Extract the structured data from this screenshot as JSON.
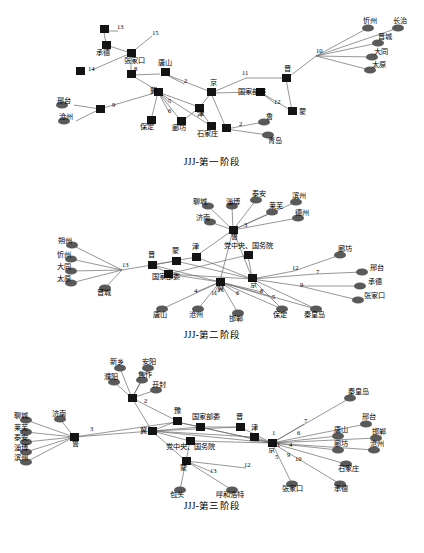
{
  "figure": {
    "title": "",
    "panels": [
      {
        "id": "panel1",
        "caption": "JJJ-第一阶段",
        "width": 424,
        "height": 150,
        "nodes": [
          {
            "id": "p1n1",
            "label": "承德",
            "shape": "square",
            "x": 106,
            "y": 42
          },
          {
            "id": "p1n2",
            "label": "",
            "shape": "square",
            "x": 104,
            "y": 25
          },
          {
            "id": "p1n3",
            "label": "13",
            "shape": "text",
            "x": 120,
            "y": 24
          },
          {
            "id": "p1n4",
            "label": "15",
            "shape": "text",
            "x": 156,
            "y": 30
          },
          {
            "id": "p1n5",
            "label": "张家口",
            "shape": "square",
            "x": 132,
            "y": 50
          },
          {
            "id": "p1n6",
            "label": "14",
            "shape": "text",
            "x": 92,
            "y": 63
          },
          {
            "id": "p1n7",
            "label": "",
            "shape": "square",
            "x": 80,
            "y": 67
          },
          {
            "id": "p1n8",
            "label": "8",
            "shape": "text",
            "x": 132,
            "y": 72
          },
          {
            "id": "p1n9",
            "label": "唐山",
            "shape": "square",
            "x": 165,
            "y": 68
          },
          {
            "id": "p1n10",
            "label": "2",
            "shape": "text",
            "x": 186,
            "y": 80
          },
          {
            "id": "p1n11",
            "label": "冀",
            "shape": "square",
            "x": 158,
            "y": 88
          },
          {
            "id": "p1n12",
            "label": "5",
            "shape": "text",
            "x": 170,
            "y": 98
          },
          {
            "id": "p1n13",
            "label": "6",
            "shape": "text",
            "x": 170,
            "y": 110
          },
          {
            "id": "p1n14",
            "label": "保定",
            "shape": "square",
            "x": 151,
            "y": 118
          },
          {
            "id": "p1n15",
            "label": "廊坊",
            "shape": "square",
            "x": 182,
            "y": 119
          },
          {
            "id": "p1n16",
            "label": "石家庄",
            "shape": "square",
            "x": 212,
            "y": 122
          },
          {
            "id": "p1n17",
            "label": "津",
            "shape": "square",
            "x": 200,
            "y": 104
          },
          {
            "id": "p1n18",
            "label": "京",
            "shape": "square",
            "x": 213,
            "y": 88
          },
          {
            "id": "p1n19",
            "label": "11",
            "shape": "text",
            "x": 248,
            "y": 72
          },
          {
            "id": "p1n20",
            "label": "晋",
            "shape": "square",
            "x": 288,
            "y": 74
          },
          {
            "id": "p1n21",
            "label": "国家部委",
            "shape": "square",
            "x": 262,
            "y": 88
          },
          {
            "id": "p1n22",
            "label": "12",
            "shape": "text",
            "x": 277,
            "y": 100
          },
          {
            "id": "p1n23",
            "label": "蒙",
            "shape": "square",
            "x": 294,
            "y": 108
          },
          {
            "id": "p1n24",
            "label": "10",
            "shape": "text",
            "x": 318,
            "y": 50
          },
          {
            "id": "p1n25",
            "label": "忻州",
            "shape": "ellipse",
            "x": 379,
            "y": 22
          },
          {
            "id": "p1n26",
            "label": "长治",
            "shape": "ellipse",
            "x": 410,
            "y": 22
          },
          {
            "id": "p1n27",
            "label": "晋城",
            "shape": "ellipse",
            "x": 388,
            "y": 38
          },
          {
            "id": "p1n28",
            "label": "大同",
            "shape": "ellipse",
            "x": 383,
            "y": 52
          },
          {
            "id": "p1n29",
            "label": "太原",
            "shape": "ellipse",
            "x": 380,
            "y": 66
          },
          {
            "id": "p1n30",
            "label": "邢台",
            "shape": "ellipse",
            "x": 72,
            "y": 102
          },
          {
            "id": "p1n31",
            "label": "沧州",
            "shape": "ellipse",
            "x": 74,
            "y": 118
          },
          {
            "id": "p1n32",
            "label": "9",
            "shape": "text",
            "x": 114,
            "y": 102
          },
          {
            "id": "p1n33",
            "label": "",
            "shape": "square",
            "x": 100,
            "y": 106
          },
          {
            "id": "p1n34",
            "label": "2",
            "shape": "text",
            "x": 240,
            "y": 122
          },
          {
            "id": "p1n35",
            "label": "",
            "shape": "square",
            "x": 228,
            "y": 125
          },
          {
            "id": "p1n36",
            "label": "鲁",
            "shape": "ellipse",
            "x": 272,
            "y": 117
          },
          {
            "id": "p1n37",
            "label": "青岛",
            "shape": "ellipse",
            "x": 278,
            "y": 132
          }
        ],
        "edge_labels": [
          "13",
          "15",
          "14",
          "8",
          "2",
          "5",
          "6",
          "11",
          "12",
          "10",
          "9",
          "2"
        ]
      },
      {
        "id": "panel2",
        "caption": "JJJ-第二阶段",
        "width": 424,
        "height": 145,
        "nodes": [
          {
            "id": "p2n1",
            "label": "聊城",
            "shape": "ellipse",
            "x": 212,
            "y": 22
          },
          {
            "id": "p2n2",
            "label": "淄博",
            "shape": "ellipse",
            "x": 238,
            "y": 22
          },
          {
            "id": "p2n3",
            "label": "泰安",
            "shape": "ellipse",
            "x": 262,
            "y": 16
          },
          {
            "id": "p2n4",
            "label": "莱芜",
            "shape": "ellipse",
            "x": 278,
            "y": 28
          },
          {
            "id": "p2n5",
            "label": "滨州",
            "shape": "ellipse",
            "x": 302,
            "y": 18
          },
          {
            "id": "p2n6",
            "label": "德州",
            "shape": "ellipse",
            "x": 304,
            "y": 34
          },
          {
            "id": "p2n7",
            "label": "济南",
            "shape": "ellipse",
            "x": 214,
            "y": 38
          },
          {
            "id": "p2n8",
            "label": "3",
            "shape": "text",
            "x": 246,
            "y": 44
          },
          {
            "id": "p2n9",
            "label": "鲁",
            "shape": "square",
            "x": 233,
            "y": 47
          },
          {
            "id": "p2n10",
            "label": "朔州",
            "shape": "ellipse",
            "x": 63,
            "y": 62
          },
          {
            "id": "p2n11",
            "label": "忻州",
            "shape": "ellipse",
            "x": 62,
            "y": 76
          },
          {
            "id": "p2n12",
            "label": "大同",
            "shape": "ellipse",
            "x": 62,
            "y": 88
          },
          {
            "id": "p2n13",
            "label": "太原",
            "shape": "ellipse",
            "x": 62,
            "y": 100
          },
          {
            "id": "p2n14",
            "label": "晋城",
            "shape": "ellipse",
            "x": 105,
            "y": 106
          },
          {
            "id": "p2n15",
            "label": "13",
            "shape": "text",
            "x": 122,
            "y": 84
          },
          {
            "id": "p2n16",
            "label": "晋",
            "shape": "square",
            "x": 152,
            "y": 82
          },
          {
            "id": "p2n17",
            "label": "蒙",
            "shape": "square",
            "x": 176,
            "y": 78
          },
          {
            "id": "p2n18",
            "label": "津",
            "shape": "square",
            "x": 196,
            "y": 74
          },
          {
            "id": "p2n19",
            "label": "国家部委",
            "shape": "square",
            "x": 168,
            "y": 92
          },
          {
            "id": "p2n20",
            "label": "党中央、国务院",
            "shape": "square",
            "x": 250,
            "y": 72
          },
          {
            "id": "p2n21",
            "label": "京",
            "shape": "square",
            "x": 252,
            "y": 96
          },
          {
            "id": "p2n22",
            "label": "12",
            "shape": "text",
            "x": 296,
            "y": 88
          },
          {
            "id": "p2n23",
            "label": "7",
            "shape": "text",
            "x": 318,
            "y": 92
          },
          {
            "id": "p2n24",
            "label": "廊坊",
            "shape": "ellipse",
            "x": 348,
            "y": 72
          },
          {
            "id": "p2n25",
            "label": "邢台",
            "shape": "ellipse",
            "x": 372,
            "y": 90
          },
          {
            "id": "p2n26",
            "label": "承德",
            "shape": "ellipse",
            "x": 370,
            "y": 104
          },
          {
            "id": "p2n27",
            "label": "张家口",
            "shape": "ellipse",
            "x": 368,
            "y": 118
          },
          {
            "id": "p2n28",
            "label": "9",
            "shape": "text",
            "x": 302,
            "y": 104
          },
          {
            "id": "p2n29",
            "label": "冀",
            "shape": "square",
            "x": 220,
            "y": 100
          },
          {
            "id": "p2n30",
            "label": "4",
            "shape": "text",
            "x": 196,
            "y": 110
          },
          {
            "id": "p2n31",
            "label": "11",
            "shape": "text",
            "x": 214,
            "y": 112
          },
          {
            "id": "p2n32",
            "label": "6",
            "shape": "text",
            "x": 238,
            "y": 112
          },
          {
            "id": "p2n33",
            "label": "8",
            "shape": "text",
            "x": 262,
            "y": 110
          },
          {
            "id": "p2n34",
            "label": "5",
            "shape": "text",
            "x": 274,
            "y": 116
          },
          {
            "id": "p2n35",
            "label": "唐山",
            "shape": "ellipse",
            "x": 160,
            "y": 128
          },
          {
            "id": "p2n36",
            "label": "沧州",
            "shape": "ellipse",
            "x": 196,
            "y": 128
          },
          {
            "id": "p2n37",
            "label": "邯郸",
            "shape": "ellipse",
            "x": 236,
            "y": 132
          },
          {
            "id": "p2n38",
            "label": "保定",
            "shape": "ellipse",
            "x": 280,
            "y": 128
          },
          {
            "id": "p2n39",
            "label": "秦皇岛",
            "shape": "ellipse",
            "x": 316,
            "y": 128
          }
        ],
        "edge_labels": [
          "3",
          "13",
          "12",
          "7",
          "9",
          "4",
          "11",
          "6",
          "8",
          "5"
        ]
      },
      {
        "id": "panel3",
        "caption": "JJJ-第三阶段",
        "width": 424,
        "height": 150,
        "nodes": [
          {
            "id": "p3n1",
            "label": "新乡",
            "shape": "ellipse",
            "x": 124,
            "y": 18
          },
          {
            "id": "p3n2",
            "label": "安阳",
            "shape": "ellipse",
            "x": 152,
            "y": 18
          },
          {
            "id": "p3n3",
            "label": "濮阳",
            "shape": "ellipse",
            "x": 118,
            "y": 32
          },
          {
            "id": "p3n4",
            "label": "焦作",
            "shape": "ellipse",
            "x": 146,
            "y": 30
          },
          {
            "id": "p3n5",
            "label": "开封",
            "shape": "ellipse",
            "x": 160,
            "y": 40
          },
          {
            "id": "p3n6",
            "label": "2",
            "shape": "text",
            "x": 146,
            "y": 54
          },
          {
            "id": "p3n7",
            "label": "",
            "shape": "square",
            "x": 132,
            "y": 48
          },
          {
            "id": "p3n8",
            "label": "秦皇岛",
            "shape": "ellipse",
            "x": 356,
            "y": 48
          },
          {
            "id": "p3n9",
            "label": "聊城",
            "shape": "ellipse",
            "x": 22,
            "y": 72
          },
          {
            "id": "p3n10",
            "label": "莱芜",
            "shape": "ellipse",
            "x": 22,
            "y": 84
          },
          {
            "id": "p3n11",
            "label": "济南",
            "shape": "ellipse",
            "x": 62,
            "y": 70
          },
          {
            "id": "p3n12",
            "label": "泰安",
            "shape": "ellipse",
            "x": 22,
            "y": 94
          },
          {
            "id": "p3n13",
            "label": "淄博",
            "shape": "ellipse",
            "x": 22,
            "y": 104
          },
          {
            "id": "p3n14",
            "label": "滨州",
            "shape": "ellipse",
            "x": 22,
            "y": 114
          },
          {
            "id": "p3n15",
            "label": "3",
            "shape": "text",
            "x": 92,
            "y": 82
          },
          {
            "id": "p3n16",
            "label": "鲁",
            "shape": "square",
            "x": 74,
            "y": 88
          },
          {
            "id": "p3n17",
            "label": "豫",
            "shape": "square",
            "x": 177,
            "y": 72
          },
          {
            "id": "p3n18",
            "label": "冀",
            "shape": "square",
            "x": 152,
            "y": 82
          },
          {
            "id": "p3n19",
            "label": "国家部委",
            "shape": "square",
            "x": 200,
            "y": 78
          },
          {
            "id": "p3n20",
            "label": "晋",
            "shape": "square",
            "x": 240,
            "y": 78
          },
          {
            "id": "p3n21",
            "label": "党中央、国务院",
            "shape": "square",
            "x": 190,
            "y": 92
          },
          {
            "id": "p3n22",
            "label": "津",
            "shape": "square",
            "x": 254,
            "y": 88
          },
          {
            "id": "p3n23",
            "label": "京",
            "shape": "square",
            "x": 272,
            "y": 94
          },
          {
            "id": "p3n24",
            "label": "7",
            "shape": "text",
            "x": 306,
            "y": 74
          },
          {
            "id": "p3n25",
            "label": "6",
            "shape": "text",
            "x": 298,
            "y": 86
          },
          {
            "id": "p3n26",
            "label": "1",
            "shape": "text",
            "x": 272,
            "y": 86
          },
          {
            "id": "p3n27",
            "label": "11",
            "shape": "text",
            "x": 276,
            "y": 98
          },
          {
            "id": "p3n28",
            "label": "4",
            "shape": "text",
            "x": 290,
            "y": 98
          },
          {
            "id": "p3n29",
            "label": "9",
            "shape": "text",
            "x": 288,
            "y": 108
          },
          {
            "id": "p3n30",
            "label": "5",
            "shape": "text",
            "x": 276,
            "y": 110
          },
          {
            "id": "p3n31",
            "label": "10",
            "shape": "text",
            "x": 296,
            "y": 112
          },
          {
            "id": "p3n32",
            "label": "邢台",
            "shape": "ellipse",
            "x": 372,
            "y": 74
          },
          {
            "id": "p3n33",
            "label": "唐山",
            "shape": "ellipse",
            "x": 344,
            "y": 86
          },
          {
            "id": "p3n34",
            "label": "邯郸",
            "shape": "ellipse",
            "x": 382,
            "y": 88
          },
          {
            "id": "p3n35",
            "label": "廊坊",
            "shape": "ellipse",
            "x": 344,
            "y": 100
          },
          {
            "id": "p3n36",
            "label": "沧州",
            "shape": "ellipse",
            "x": 380,
            "y": 100
          },
          {
            "id": "p3n37",
            "label": "石家庄",
            "shape": "ellipse",
            "x": 352,
            "y": 114
          },
          {
            "id": "p3n38",
            "label": "蒙",
            "shape": "square",
            "x": 182,
            "y": 112
          },
          {
            "id": "p3n39",
            "label": "13",
            "shape": "text",
            "x": 214,
            "y": 120
          },
          {
            "id": "p3n40",
            "label": "12",
            "shape": "text",
            "x": 246,
            "y": 116
          },
          {
            "id": "p3n41",
            "label": "包头",
            "shape": "ellipse",
            "x": 178,
            "y": 140
          },
          {
            "id": "p3n42",
            "label": "呼和浩特",
            "shape": "ellipse",
            "x": 236,
            "y": 140
          },
          {
            "id": "p3n43",
            "label": "张家口",
            "shape": "ellipse",
            "x": 292,
            "y": 134
          },
          {
            "id": "p3n44",
            "label": "承德",
            "shape": "ellipse",
            "x": 342,
            "y": 134
          }
        ],
        "edge_labels": [
          "2",
          "3",
          "7",
          "6",
          "1",
          "11",
          "4",
          "9",
          "5",
          "10",
          "13",
          "12"
        ]
      }
    ]
  },
  "colors": {
    "node_square": "#1a1a1a",
    "node_ellipse": "#555555",
    "edge": "#666666",
    "text": "#000000",
    "background": "#ffffff"
  }
}
